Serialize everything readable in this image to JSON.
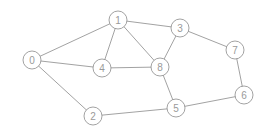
{
  "diagram": {
    "type": "undirected-graph",
    "nodes": [
      {
        "id": "0",
        "label": "0"
      },
      {
        "id": "1",
        "label": "1"
      },
      {
        "id": "2",
        "label": "2"
      },
      {
        "id": "3",
        "label": "3"
      },
      {
        "id": "4",
        "label": "4"
      },
      {
        "id": "5",
        "label": "5"
      },
      {
        "id": "6",
        "label": "6"
      },
      {
        "id": "7",
        "label": "7"
      },
      {
        "id": "8",
        "label": "8"
      }
    ],
    "edges": [
      [
        "0",
        "1"
      ],
      [
        "0",
        "4"
      ],
      [
        "0",
        "2"
      ],
      [
        "1",
        "4"
      ],
      [
        "1",
        "8"
      ],
      [
        "1",
        "3"
      ],
      [
        "3",
        "8"
      ],
      [
        "3",
        "7"
      ],
      [
        "4",
        "8"
      ],
      [
        "8",
        "5"
      ],
      [
        "2",
        "5"
      ],
      [
        "5",
        "6"
      ],
      [
        "6",
        "7"
      ]
    ],
    "colors": {
      "edge": "#8a8a8a",
      "node_stroke": "#8a8a8a",
      "node_fill": "#ffffff",
      "label": "#9a9a9a"
    }
  }
}
